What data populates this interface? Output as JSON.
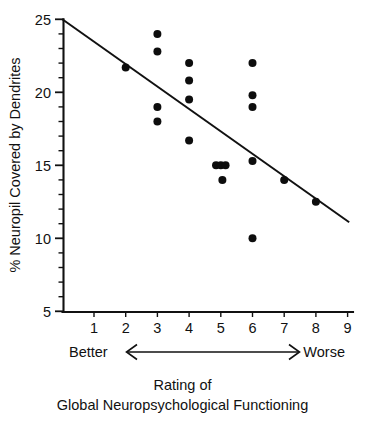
{
  "chart_data": {
    "type": "scatter",
    "title": "",
    "xlabel": "Rating of Global Neuropsychological Functioning",
    "ylabel": "% Neuropil Covered by Dendrites",
    "xlim": [
      0,
      9
    ],
    "ylim": [
      5,
      25
    ],
    "grid": false,
    "legend": "none",
    "x_ticks": [
      1,
      2,
      3,
      4,
      5,
      6,
      7,
      8,
      9
    ],
    "x_tick_labels": [
      "1",
      "2",
      "3",
      "4",
      "5",
      "6",
      "7",
      "8",
      "9"
    ],
    "y_ticks": [
      5,
      10,
      15,
      20,
      25
    ],
    "y_tick_labels": [
      "5",
      "10",
      "15",
      "20",
      "25"
    ],
    "y_minor_tick_step": 1,
    "points": [
      {
        "x": 2.0,
        "y": 21.7
      },
      {
        "x": 3.0,
        "y": 24.0
      },
      {
        "x": 3.0,
        "y": 22.8
      },
      {
        "x": 3.0,
        "y": 19.0
      },
      {
        "x": 3.0,
        "y": 18.0
      },
      {
        "x": 4.0,
        "y": 22.0
      },
      {
        "x": 4.0,
        "y": 20.8
      },
      {
        "x": 4.0,
        "y": 19.5
      },
      {
        "x": 4.0,
        "y": 16.7
      },
      {
        "x": 4.85,
        "y": 15.0
      },
      {
        "x": 5.0,
        "y": 15.0
      },
      {
        "x": 5.15,
        "y": 15.0
      },
      {
        "x": 5.05,
        "y": 14.0
      },
      {
        "x": 6.0,
        "y": 22.0
      },
      {
        "x": 6.0,
        "y": 19.8
      },
      {
        "x": 6.0,
        "y": 19.0
      },
      {
        "x": 6.0,
        "y": 15.3
      },
      {
        "x": 6.0,
        "y": 10.0
      },
      {
        "x": 7.0,
        "y": 14.0
      },
      {
        "x": 8.0,
        "y": 12.5
      }
    ],
    "regression_line": {
      "x1": 0.0,
      "y1": 25.0,
      "x2": 9.05,
      "y2": 11.1
    },
    "annotations": {
      "left_label": "Better",
      "right_label": "Worse",
      "arrow": "double-headed-horizontal-arrow"
    },
    "caption_lines": [
      "Rating of",
      "Global Neuropsychological Functioning"
    ],
    "colors": {
      "point": "#0d0d0d",
      "line": "#111111",
      "axis": "#111111",
      "background": "#ffffff"
    }
  },
  "axes": {
    "y_axis_title": "% Neuropil Covered by Dendrites",
    "x_axis_caption_line1": "Rating of",
    "x_axis_caption_line2": "Global Neuropsychological Functioning"
  },
  "scale_annotation": {
    "better": "Better",
    "worse": "Worse"
  }
}
